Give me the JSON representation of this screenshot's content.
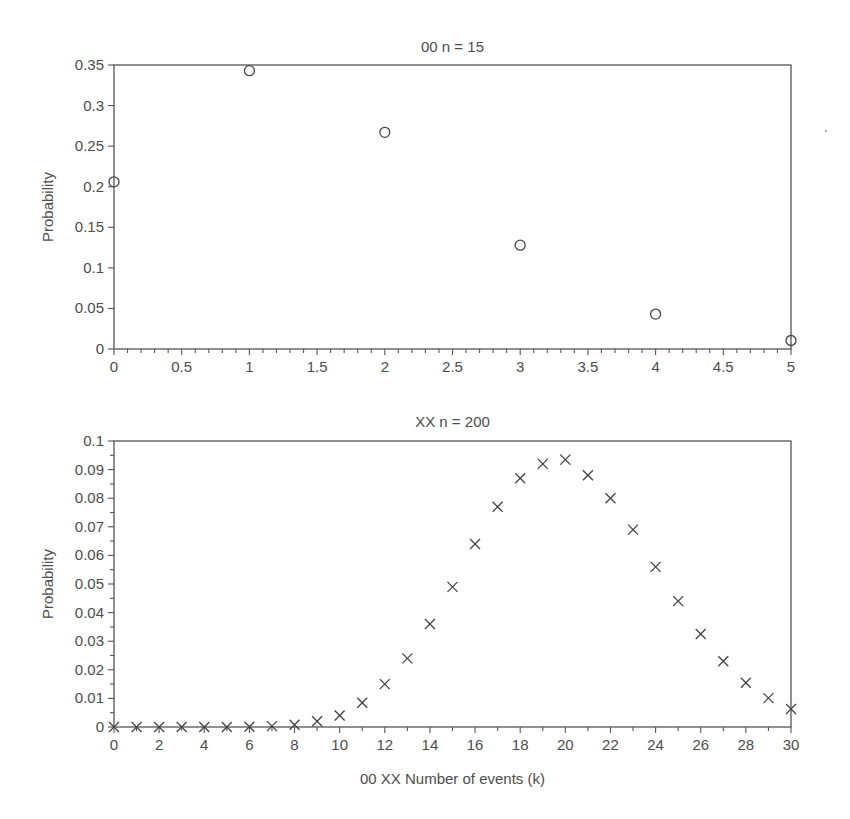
{
  "chart_data": [
    {
      "type": "scatter",
      "title": "00 n = 15",
      "xlabel": "",
      "ylabel": "Probability",
      "marker": "circle",
      "xlim": [
        0,
        5
      ],
      "ylim": [
        0,
        0.35
      ],
      "xticks": [
        "0",
        "0.5",
        "1",
        "1.5",
        "2",
        "2.5",
        "3",
        "3.5",
        "4",
        "4.5",
        "5"
      ],
      "yticks": [
        "0",
        "0.05",
        "0.1",
        "0.15",
        "0.2",
        "0.25",
        "0.3",
        "0.35"
      ],
      "x": [
        0,
        1,
        2,
        3,
        4,
        5
      ],
      "y": [
        0.206,
        0.343,
        0.267,
        0.128,
        0.043,
        0.0105
      ],
      "grid": false
    },
    {
      "type": "scatter",
      "title": "XX n = 200",
      "xlabel": "00 XX Number of events (k)",
      "ylabel": "Probability",
      "marker": "x",
      "xlim": [
        0,
        30
      ],
      "ylim": [
        0,
        0.1
      ],
      "xticks": [
        "0",
        "2",
        "4",
        "6",
        "8",
        "10",
        "12",
        "14",
        "16",
        "18",
        "20",
        "22",
        "24",
        "26",
        "28",
        "30"
      ],
      "yticks": [
        "0",
        "0.01",
        "0.02",
        "0.03",
        "0.04",
        "0.05",
        "0.06",
        "0.07",
        "0.08",
        "0.09",
        "0.1"
      ],
      "x": [
        0,
        1,
        2,
        3,
        4,
        5,
        6,
        7,
        8,
        9,
        10,
        11,
        12,
        13,
        14,
        15,
        16,
        17,
        18,
        19,
        20,
        21,
        22,
        23,
        24,
        25,
        26,
        27,
        28,
        29,
        30
      ],
      "y": [
        0,
        0,
        0,
        0,
        0,
        0,
        0.0001,
        0.0003,
        0.0008,
        0.002,
        0.004,
        0.0085,
        0.015,
        0.024,
        0.036,
        0.049,
        0.064,
        0.077,
        0.087,
        0.092,
        0.0935,
        0.088,
        0.08,
        0.069,
        0.056,
        0.044,
        0.0325,
        0.023,
        0.0155,
        0.0101,
        0.0063
      ],
      "grid": false
    }
  ],
  "plots": {
    "top": {
      "title": "00 n = 15",
      "ylabel": "Probability"
    },
    "bottom": {
      "title": "XX n = 200",
      "ylabel": "Probability",
      "xlabel": "00 XX Number of events (k)"
    }
  }
}
